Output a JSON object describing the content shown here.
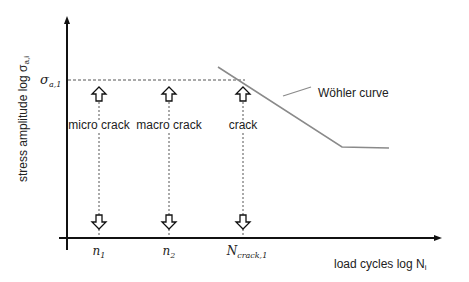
{
  "diagram": {
    "y_axis_label": "stress amplitude log σ",
    "y_axis_label_sub": "a,i",
    "x_axis_label": "load cycles log N",
    "x_axis_label_sub": "i",
    "sigma_label": "σ",
    "sigma_sub": "a,1",
    "curve_label": "Wöhler curve",
    "stages": [
      {
        "label": "micro crack",
        "tick": "n",
        "tick_sub": "1"
      },
      {
        "label": "macro crack",
        "tick": "n",
        "tick_sub": "2"
      },
      {
        "label": "crack",
        "tick": "N",
        "tick_sub": "crack,1"
      }
    ],
    "colors": {
      "axis": "#111111",
      "curve": "#8a8a8a",
      "dashed": "#555555",
      "text": "#222222"
    }
  }
}
